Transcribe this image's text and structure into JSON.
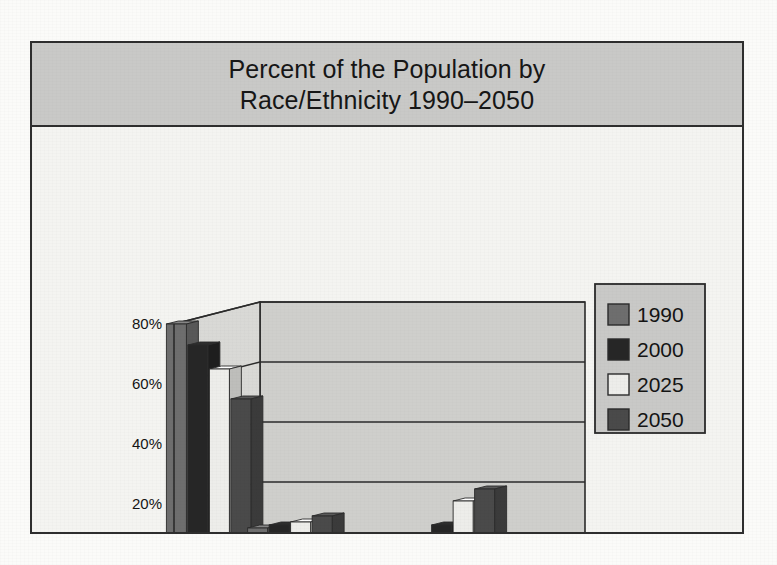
{
  "figure": {
    "title_lines": [
      "Percent of the Population by",
      "Race/Ethnicity 1990–2050"
    ]
  },
  "chart_data": {
    "type": "bar",
    "title": "Percent of the Population by Race/Ethnicity 1990–2050",
    "xlabel": "",
    "ylabel": "",
    "ylim": [
      0,
      80
    ],
    "y_ticks": [
      0,
      20,
      40,
      60,
      80
    ],
    "y_tick_labels": [
      "0%",
      "20%",
      "40%",
      "60%",
      "80%"
    ],
    "grid": true,
    "style": "3d-clustered-column",
    "legend_position": "right",
    "categories": [
      "White",
      "Black",
      "Asian",
      "Hispanic"
    ],
    "series": [
      {
        "name": "1990",
        "color": "#6e6e6e",
        "values": [
          80,
          12,
          3,
          9
        ]
      },
      {
        "name": "2000",
        "color": "#262626",
        "values": [
          73,
          13,
          4,
          13
        ]
      },
      {
        "name": "2025",
        "color": "#ededea",
        "values": [
          65,
          14,
          5,
          21
        ]
      },
      {
        "name": "2050",
        "color": "#4a4a4a",
        "values": [
          55,
          16,
          7,
          25
        ]
      }
    ]
  }
}
